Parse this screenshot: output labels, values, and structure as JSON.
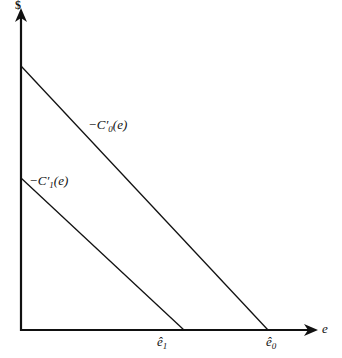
{
  "diagram": {
    "y_axis_label": "$",
    "x_axis_label": "e",
    "curves": [
      {
        "label_prefix": "−C",
        "label_prime": "′",
        "label_sub": "0",
        "label_suffix": "(e)",
        "y_intercept_px": 66,
        "x_intercept_px": 268
      },
      {
        "label_prefix": "−C",
        "label_prime": "′",
        "label_sub": "1",
        "label_suffix": "(e)",
        "y_intercept_px": 178,
        "x_intercept_px": 184
      }
    ],
    "x_ticks": [
      {
        "base": "ê",
        "sub": "1"
      },
      {
        "base": "ê",
        "sub": "0"
      }
    ]
  },
  "colors": {
    "line": "#111111",
    "background": "#ffffff"
  }
}
